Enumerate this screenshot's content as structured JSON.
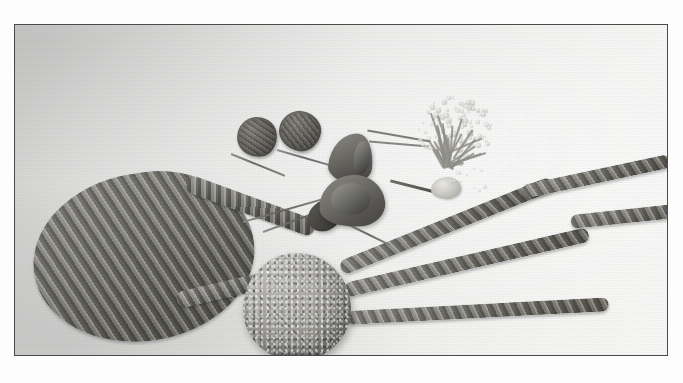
{
  "page": {
    "background_color": "#fdfdfd",
    "width": 683,
    "height": 383
  },
  "figure": {
    "type": "scanned-photograph",
    "color_mode": "black-and-white halftone",
    "frame": {
      "border_color": "#4a4a4a",
      "left": 14,
      "top": 24,
      "width": 654,
      "height": 332
    },
    "backdrop_description": "pale gray fabric backdrop, lit from upper right",
    "subject_summary": "Floral craft materials laid out flat: a foam ball, floral-taped wire loop and trailing stems, dried rose buds, curled leaves and a gypsophila spray",
    "objects": [
      {
        "name": "teardrop-loop",
        "label": "Floral-taped wire loop",
        "description": "Teardrop shaped loop of wire wrapped in spiral floral tape, left of centre"
      },
      {
        "name": "foam-ball",
        "label": "Foam ball",
        "description": "Textured granular styrofoam sphere at the centre where all stems converge"
      },
      {
        "name": "stem-top",
        "label": "Upper trailing stem",
        "description": "Taped wire stem curving up to the right edge"
      },
      {
        "name": "stem-mid",
        "label": "Middle trailing stem",
        "description": "Taped wire stem running right with a gentle rise"
      },
      {
        "name": "stem-low",
        "label": "Lower trailing stem",
        "description": "Nearly horizontal taped stem ending short of the right edge"
      },
      {
        "name": "rose-bud-left",
        "label": "Dried rose bud",
        "description": "Dark dried rose head on a thin wire stem"
      },
      {
        "name": "rose-bud-right",
        "label": "Dried rose bud",
        "description": "Second dried rose head on a thin wire stem"
      },
      {
        "name": "curled-leaf-upper",
        "label": "Curled leaf",
        "description": "Dark curled leaf or petal cone, upper of the pair"
      },
      {
        "name": "curled-leaf-lower",
        "label": "Curled leaf",
        "description": "Wider curled leaf resting below the upper one"
      },
      {
        "name": "gypsophila-spray",
        "label": "Gypsophila spray",
        "description": "Pale airy spray of baby's-breath florets on fine twigs"
      }
    ]
  },
  "caption": {
    "text": "",
    "note": "caption line is cropped at the bottom edge of the page"
  }
}
